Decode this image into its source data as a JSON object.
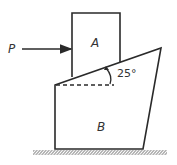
{
  "diagram": {
    "type": "statics-free-body",
    "labels": {
      "force": "P",
      "block_top": "A",
      "block_bottom": "B",
      "angle": "25°"
    },
    "angle_degrees": 25,
    "colors": {
      "stroke": "#2a2a2a",
      "text": "#333333",
      "background": "#ffffff"
    },
    "elements": [
      {
        "id": "block-a",
        "shape": "rectangle",
        "label": "A",
        "rests_on": "incline of B"
      },
      {
        "id": "block-b",
        "shape": "trapezoid",
        "label": "B",
        "top_surface": "incline at 25°"
      },
      {
        "id": "force-p",
        "shape": "arrow",
        "label": "P",
        "direction": "right",
        "acts_on": "A"
      },
      {
        "id": "ground",
        "shape": "hatched-line"
      },
      {
        "id": "reference-line",
        "shape": "dashed-horizontal"
      }
    ]
  }
}
